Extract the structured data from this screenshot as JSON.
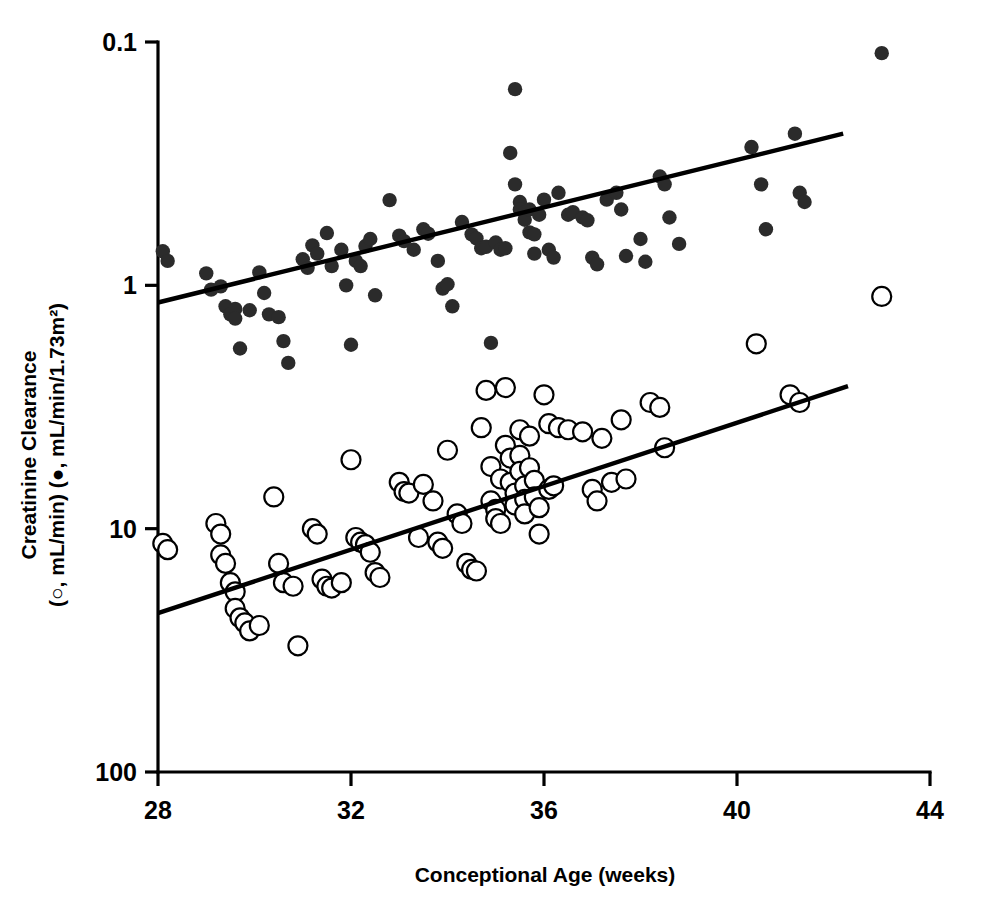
{
  "figure": {
    "background_color": "#ffffff",
    "foreground_color": "#000000",
    "marker_filled_color": "#2b2b2b",
    "marker_open_fill": "#ffffff"
  },
  "axes": {
    "x_title": "Conceptional Age (weeks)",
    "y_title_line1": "Creatinine Clearance",
    "y_title_line2": "(○, mL/min) (●, mL/min/1.73m²)",
    "x_ticks": [
      "28",
      "32",
      "36",
      "40",
      "44"
    ],
    "y_ticks": [
      "100",
      "10",
      "1",
      "0.1"
    ]
  },
  "chart_data": {
    "type": "scatter",
    "title": "",
    "xlabel": "Conceptional Age (weeks)",
    "ylabel": "Creatinine Clearance (○, mL/min) (●, mL/min/1.73m²)",
    "xlim": [
      28,
      44
    ],
    "ylim": [
      0.1,
      100
    ],
    "yscale": "log",
    "xscale": "linear",
    "xticks": [
      28,
      32,
      36,
      40,
      44
    ],
    "yticks": [
      0.1,
      1,
      10,
      100
    ],
    "grid": false,
    "legend": "none",
    "series": [
      {
        "name": "mL/min/1.73m2 (filled circles)",
        "marker": "filled-circle",
        "color": "#2b2b2b",
        "points": [
          [
            28.1,
            13.8
          ],
          [
            28.2,
            12.6
          ],
          [
            29.0,
            11.2
          ],
          [
            29.1,
            9.6
          ],
          [
            29.3,
            9.9
          ],
          [
            29.4,
            8.2
          ],
          [
            29.5,
            7.6
          ],
          [
            29.6,
            8.0
          ],
          [
            29.6,
            7.3
          ],
          [
            29.7,
            5.5
          ],
          [
            29.9,
            7.9
          ],
          [
            30.1,
            11.3
          ],
          [
            30.2,
            9.3
          ],
          [
            30.3,
            7.6
          ],
          [
            30.5,
            7.4
          ],
          [
            30.6,
            5.9
          ],
          [
            30.7,
            4.8
          ],
          [
            31.0,
            12.8
          ],
          [
            31.1,
            11.8
          ],
          [
            31.2,
            14.6
          ],
          [
            31.3,
            13.5
          ],
          [
            31.5,
            16.4
          ],
          [
            31.6,
            12.0
          ],
          [
            31.8,
            14.0
          ],
          [
            31.9,
            10.0
          ],
          [
            32.0,
            5.7
          ],
          [
            32.1,
            12.6
          ],
          [
            32.2,
            12.0
          ],
          [
            32.3,
            14.5
          ],
          [
            32.4,
            15.5
          ],
          [
            32.5,
            9.1
          ],
          [
            32.8,
            22.4
          ],
          [
            33.0,
            16.0
          ],
          [
            33.1,
            15.2
          ],
          [
            33.3,
            14.0
          ],
          [
            33.5,
            17.0
          ],
          [
            33.6,
            16.3
          ],
          [
            33.8,
            12.6
          ],
          [
            33.9,
            9.7
          ],
          [
            34.0,
            10.1
          ],
          [
            34.1,
            8.2
          ],
          [
            34.3,
            18.2
          ],
          [
            34.5,
            16.2
          ],
          [
            34.6,
            15.6
          ],
          [
            34.7,
            14.2
          ],
          [
            34.8,
            14.4
          ],
          [
            34.9,
            5.8
          ],
          [
            35.0,
            15.0
          ],
          [
            35.1,
            14.0
          ],
          [
            35.2,
            14.2
          ],
          [
            35.3,
            35.0
          ],
          [
            35.4,
            26.0
          ],
          [
            35.4,
            64.0
          ],
          [
            35.5,
            22.0
          ],
          [
            35.5,
            20.5
          ],
          [
            35.6,
            20.0
          ],
          [
            35.6,
            18.6
          ],
          [
            35.7,
            20.5
          ],
          [
            35.7,
            16.5
          ],
          [
            35.8,
            16.2
          ],
          [
            35.8,
            13.5
          ],
          [
            35.9,
            19.5
          ],
          [
            36.0,
            22.5
          ],
          [
            36.1,
            14.0
          ],
          [
            36.2,
            13.0
          ],
          [
            36.3,
            24.0
          ],
          [
            36.5,
            19.5
          ],
          [
            36.6,
            20.0
          ],
          [
            36.8,
            19.0
          ],
          [
            36.9,
            18.5
          ],
          [
            37.0,
            13.0
          ],
          [
            37.1,
            12.2
          ],
          [
            37.3,
            22.5
          ],
          [
            37.5,
            24.0
          ],
          [
            37.6,
            20.5
          ],
          [
            37.7,
            13.2
          ],
          [
            38.0,
            15.5
          ],
          [
            38.1,
            12.5
          ],
          [
            38.4,
            28.0
          ],
          [
            38.5,
            26.0
          ],
          [
            38.6,
            19.0
          ],
          [
            38.8,
            14.8
          ],
          [
            40.3,
            37.0
          ],
          [
            40.5,
            26.0
          ],
          [
            40.6,
            17.0
          ],
          [
            41.2,
            42.0
          ],
          [
            41.3,
            24.0
          ],
          [
            41.4,
            22.0
          ],
          [
            43.0,
            90.0
          ]
        ]
      },
      {
        "name": "mL/min (open circles)",
        "marker": "open-circle",
        "color": "#000000",
        "points": [
          [
            28.1,
            0.87
          ],
          [
            28.2,
            0.82
          ],
          [
            29.2,
            1.05
          ],
          [
            29.3,
            0.95
          ],
          [
            29.3,
            0.78
          ],
          [
            29.4,
            0.72
          ],
          [
            29.5,
            0.6
          ],
          [
            29.6,
            0.55
          ],
          [
            29.6,
            0.47
          ],
          [
            29.7,
            0.43
          ],
          [
            29.8,
            0.41
          ],
          [
            29.9,
            0.38
          ],
          [
            30.1,
            0.4
          ],
          [
            30.4,
            1.35
          ],
          [
            30.5,
            0.72
          ],
          [
            30.6,
            0.6
          ],
          [
            30.8,
            0.58
          ],
          [
            30.9,
            0.33
          ],
          [
            31.2,
            1.0
          ],
          [
            31.3,
            0.95
          ],
          [
            31.4,
            0.62
          ],
          [
            31.5,
            0.58
          ],
          [
            31.6,
            0.57
          ],
          [
            31.8,
            0.6
          ],
          [
            32.0,
            1.92
          ],
          [
            32.1,
            0.92
          ],
          [
            32.2,
            0.88
          ],
          [
            32.3,
            0.86
          ],
          [
            32.4,
            0.8
          ],
          [
            32.5,
            0.66
          ],
          [
            32.6,
            0.63
          ],
          [
            33.0,
            1.55
          ],
          [
            33.1,
            1.42
          ],
          [
            33.2,
            1.4
          ],
          [
            33.4,
            0.92
          ],
          [
            33.5,
            1.52
          ],
          [
            33.7,
            1.3
          ],
          [
            33.8,
            0.88
          ],
          [
            33.9,
            0.83
          ],
          [
            34.0,
            2.1
          ],
          [
            34.2,
            1.15
          ],
          [
            34.3,
            1.05
          ],
          [
            34.4,
            0.72
          ],
          [
            34.5,
            0.68
          ],
          [
            34.6,
            0.67
          ],
          [
            34.7,
            2.6
          ],
          [
            34.8,
            3.7
          ],
          [
            34.9,
            1.8
          ],
          [
            34.9,
            1.3
          ],
          [
            35.0,
            1.2
          ],
          [
            35.0,
            1.1
          ],
          [
            35.1,
            1.6
          ],
          [
            35.1,
            1.05
          ],
          [
            35.2,
            3.8
          ],
          [
            35.2,
            2.2
          ],
          [
            35.3,
            1.95
          ],
          [
            35.3,
            1.55
          ],
          [
            35.4,
            1.4
          ],
          [
            35.4,
            1.25
          ],
          [
            35.5,
            2.55
          ],
          [
            35.5,
            2.0
          ],
          [
            35.5,
            1.72
          ],
          [
            35.6,
            1.5
          ],
          [
            35.6,
            1.32
          ],
          [
            35.6,
            1.15
          ],
          [
            35.7,
            2.4
          ],
          [
            35.7,
            1.78
          ],
          [
            35.8,
            1.58
          ],
          [
            35.8,
            1.35
          ],
          [
            35.9,
            1.22
          ],
          [
            35.9,
            0.95
          ],
          [
            36.0,
            3.55
          ],
          [
            36.1,
            2.7
          ],
          [
            36.1,
            1.45
          ],
          [
            36.2,
            1.5
          ],
          [
            36.3,
            2.6
          ],
          [
            36.5,
            2.55
          ],
          [
            36.8,
            2.5
          ],
          [
            37.0,
            1.45
          ],
          [
            37.1,
            1.3
          ],
          [
            37.2,
            2.35
          ],
          [
            37.4,
            1.55
          ],
          [
            37.6,
            2.8
          ],
          [
            37.7,
            1.6
          ],
          [
            38.2,
            3.3
          ],
          [
            38.4,
            3.15
          ],
          [
            38.5,
            2.15
          ],
          [
            40.4,
            5.75
          ],
          [
            41.1,
            3.55
          ],
          [
            41.3,
            3.3
          ],
          [
            43.0,
            9.0
          ]
        ]
      }
    ],
    "fit_lines": [
      {
        "name": "regression-filled",
        "x_start": 28.0,
        "y_start": 8.5,
        "x_end": 42.2,
        "y_end": 42.0
      },
      {
        "name": "regression-open",
        "x_start": 28.0,
        "y_start": 0.45,
        "x_end": 42.3,
        "y_end": 3.85
      }
    ]
  }
}
